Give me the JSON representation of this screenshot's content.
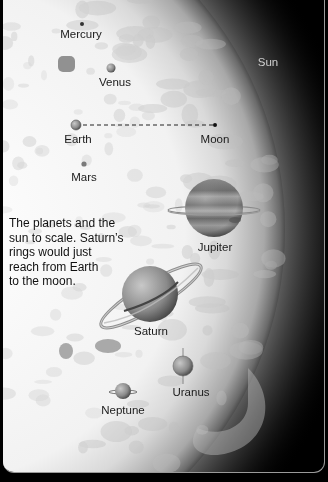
{
  "diagram": {
    "title_caption_lines": [
      "The planets and the",
      "sun to scale. Saturn’s",
      "rings would just",
      "reach from Earth",
      "to the moon."
    ],
    "bodies": {
      "sun": "Sun",
      "mercury": "Mercury",
      "venus": "Venus",
      "earth": "Earth",
      "moon": "Moon",
      "mars": "Mars",
      "jupiter": "Jupiter",
      "saturn": "Saturn",
      "uranus": "Uranus",
      "neptune": "Neptune"
    },
    "connector": "earth-moon dashed line",
    "colors": {
      "sun_core": "#f4f4f4",
      "sun_mottle": "#b9b9b9",
      "background": "#000000",
      "planet_gray": "#8a8a8a",
      "label_text": "#1a1a1a",
      "sun_label": "#cfcfcf"
    }
  }
}
